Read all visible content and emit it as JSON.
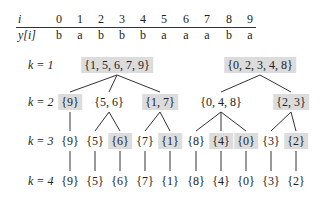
{
  "table": {
    "row_i_label": "i",
    "row_y_label": "y[i]",
    "indices": [
      "0",
      "1",
      "2",
      "3",
      "4",
      "5",
      "6",
      "7",
      "8",
      "9"
    ],
    "values": [
      "b",
      "a",
      "b",
      "b",
      "b",
      "a",
      "a",
      "a",
      "b",
      "a"
    ],
    "x_positions": [
      59,
      80,
      101,
      122,
      143,
      164,
      186,
      207,
      229,
      250
    ]
  },
  "levels": [
    {
      "label": "k = 1",
      "y": 65
    },
    {
      "label": "k = 2",
      "y": 102
    },
    {
      "label": "k = 3",
      "y": 141
    },
    {
      "label": "k = 4",
      "y": 181
    }
  ],
  "nodes": [
    {
      "id": "n1a",
      "text": "{1, 5, 6, 7, 9}",
      "x": 117,
      "y": 65,
      "highlight": true
    },
    {
      "id": "n1b",
      "text": "{0, 2, 3, 4, 8}",
      "x": 260,
      "y": 65,
      "highlight": true
    },
    {
      "id": "n2a",
      "text": "{9}",
      "x": 70,
      "y": 102,
      "highlight": true
    },
    {
      "id": "n2b",
      "text": "{5, 6}",
      "x": 109,
      "y": 102,
      "highlight": false
    },
    {
      "id": "n2c",
      "text": "{1, 7}",
      "x": 160,
      "y": 102,
      "highlight": true
    },
    {
      "id": "n2d",
      "text": "{0, 4, 8}",
      "x": 221,
      "y": 102,
      "highlight": false
    },
    {
      "id": "n2e",
      "text": "{2, 3}",
      "x": 291,
      "y": 102,
      "highlight": true
    },
    {
      "id": "n3a",
      "text": "{9}",
      "x": 70,
      "y": 141,
      "highlight": false
    },
    {
      "id": "n3b",
      "text": "{5}",
      "x": 95,
      "y": 141,
      "highlight": false
    },
    {
      "id": "n3c",
      "text": "{6}",
      "x": 120,
      "y": 141,
      "highlight": true
    },
    {
      "id": "n3d",
      "text": "{7}",
      "x": 145,
      "y": 141,
      "highlight": false
    },
    {
      "id": "n3e",
      "text": "{1}",
      "x": 170,
      "y": 141,
      "highlight": true
    },
    {
      "id": "n3f",
      "text": "{8}",
      "x": 196,
      "y": 141,
      "highlight": false
    },
    {
      "id": "n3g",
      "text": "{4}",
      "x": 221,
      "y": 141,
      "highlight": true
    },
    {
      "id": "n3h",
      "text": "{0}",
      "x": 246,
      "y": 141,
      "highlight": true
    },
    {
      "id": "n3i",
      "text": "{3}",
      "x": 271,
      "y": 141,
      "highlight": false
    },
    {
      "id": "n3j",
      "text": "{2}",
      "x": 296,
      "y": 141,
      "highlight": true
    },
    {
      "id": "n4a",
      "text": "{9}",
      "x": 70,
      "y": 181,
      "highlight": false
    },
    {
      "id": "n4b",
      "text": "{5}",
      "x": 95,
      "y": 181,
      "highlight": false
    },
    {
      "id": "n4c",
      "text": "{6}",
      "x": 120,
      "y": 181,
      "highlight": false
    },
    {
      "id": "n4d",
      "text": "{7}",
      "x": 145,
      "y": 181,
      "highlight": false
    },
    {
      "id": "n4e",
      "text": "{1}",
      "x": 170,
      "y": 181,
      "highlight": false
    },
    {
      "id": "n4f",
      "text": "{8}",
      "x": 196,
      "y": 181,
      "highlight": false
    },
    {
      "id": "n4g",
      "text": "{4}",
      "x": 221,
      "y": 181,
      "highlight": false
    },
    {
      "id": "n4h",
      "text": "{0}",
      "x": 246,
      "y": 181,
      "highlight": false
    },
    {
      "id": "n4i",
      "text": "{3}",
      "x": 271,
      "y": 181,
      "highlight": false
    },
    {
      "id": "n4j",
      "text": "{2}",
      "x": 296,
      "y": 181,
      "highlight": false
    }
  ],
  "edges": [
    [
      "n1a",
      "n2a"
    ],
    [
      "n1a",
      "n2b"
    ],
    [
      "n1a",
      "n2c"
    ],
    [
      "n1b",
      "n2d"
    ],
    [
      "n1b",
      "n2e"
    ],
    [
      "n2a",
      "n3a"
    ],
    [
      "n2b",
      "n3b"
    ],
    [
      "n2b",
      "n3c"
    ],
    [
      "n2c",
      "n3d"
    ],
    [
      "n2c",
      "n3e"
    ],
    [
      "n2d",
      "n3f"
    ],
    [
      "n2d",
      "n3g"
    ],
    [
      "n2d",
      "n3h"
    ],
    [
      "n2e",
      "n3i"
    ],
    [
      "n2e",
      "n3j"
    ],
    [
      "n3a",
      "n4a"
    ],
    [
      "n3b",
      "n4b"
    ],
    [
      "n3c",
      "n4c"
    ],
    [
      "n3d",
      "n4d"
    ],
    [
      "n3e",
      "n4e"
    ],
    [
      "n3f",
      "n4f"
    ],
    [
      "n3g",
      "n4g"
    ],
    [
      "n3h",
      "n4h"
    ],
    [
      "n3i",
      "n4i"
    ],
    [
      "n3j",
      "n4j"
    ]
  ]
}
